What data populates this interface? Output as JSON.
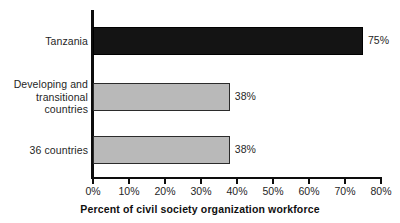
{
  "chart_data": {
    "type": "bar",
    "orientation": "horizontal",
    "title": "",
    "subtitle": "",
    "xlabel": "Percent of civil society organization workforce",
    "ylabel": "",
    "categories": [
      "Tanzania",
      "Developing and\ntransitional\ncountries",
      "36 countries"
    ],
    "values": [
      75,
      38,
      38
    ],
    "data_labels": [
      "75%",
      "38%",
      "38%"
    ],
    "bar_colors": [
      "#141414",
      "#b9b9b9",
      "#b9b9b9"
    ],
    "xlim": [
      0,
      80
    ],
    "xticks": [
      0,
      10,
      20,
      30,
      40,
      50,
      60,
      70,
      80
    ],
    "xtick_labels": [
      "0%",
      "10%",
      "20%",
      "30%",
      "40%",
      "50%",
      "60%",
      "70%",
      "80%"
    ],
    "grid": false,
    "legend": false,
    "legend_position": "none",
    "axis_color": "#0d0d0d",
    "bar_border_color": "#2b2b2b",
    "background": "#ffffff"
  },
  "geometry": {
    "plot_left_px": 93,
    "plot_right_px": 381,
    "px_per_percent": 3.6,
    "bars": [
      {
        "top": 27,
        "height": 28
      },
      {
        "top": 83,
        "height": 28
      },
      {
        "top": 136,
        "height": 28
      }
    ]
  }
}
